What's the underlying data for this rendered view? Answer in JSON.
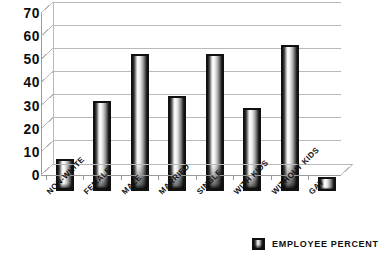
{
  "chart_data": {
    "type": "bar",
    "title": "",
    "subtitle": "",
    "xlabel": "",
    "ylabel": "",
    "ylim": [
      0,
      70
    ],
    "ytick_step": 10,
    "yticks": [
      70,
      60,
      50,
      40,
      30,
      20,
      10,
      0
    ],
    "grid": true,
    "legend_position": "bottom-right",
    "categories": [
      "NON-WHITE",
      "FEMALE",
      "MALE",
      "MARRIED",
      "SINGLE",
      "WITH KIDS",
      "WITHOUT KIDS",
      "GAY"
    ],
    "series": [
      {
        "name": "EMPLOYEE PERCENT",
        "values": [
          14,
          39,
          59,
          41,
          59,
          36,
          63,
          6
        ]
      }
    ]
  },
  "legend": {
    "label": "EMPLOYEE PERCENT",
    "swatch_name": "employee-percent-swatch"
  },
  "colors": {
    "background": "#ffffff",
    "axis": "#9a9a9a",
    "gridline": "#b9b9b9",
    "text": "#111111",
    "bar_border": "#111111",
    "bar_fill_light": "#fbfbfb",
    "bar_fill_dark": "#101010"
  }
}
